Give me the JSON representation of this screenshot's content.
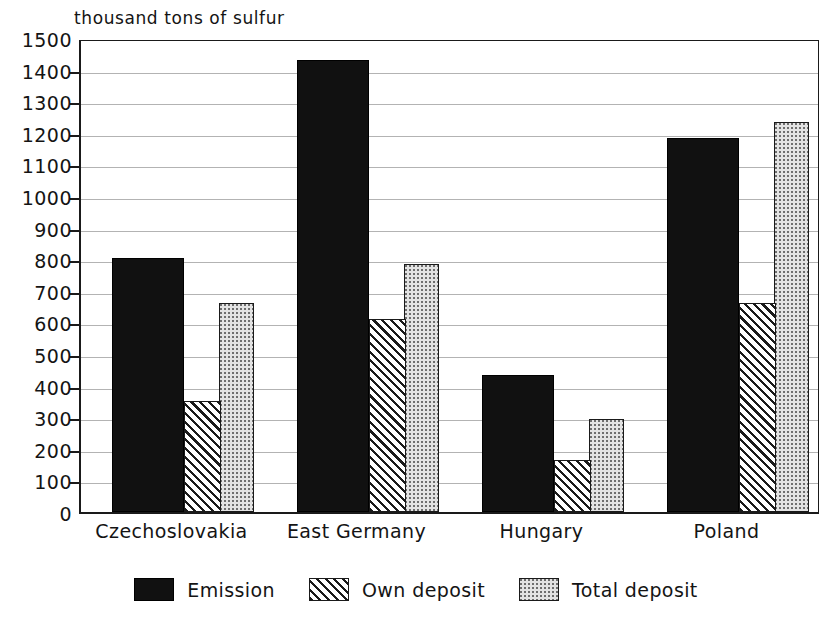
{
  "chart_data": {
    "type": "bar",
    "title": "thousand tons of sulfur",
    "xlabel": "",
    "ylabel": "thousand tons of sulfur",
    "ylim": [
      0,
      1500
    ],
    "ytick_step": 100,
    "yticks": [
      0,
      100,
      200,
      300,
      400,
      500,
      600,
      700,
      800,
      900,
      1000,
      1100,
      1200,
      1300,
      1400,
      1500
    ],
    "ytick_labels": [
      "0",
      "100",
      "200",
      "300",
      "400",
      "500",
      "600",
      "700",
      "800",
      "900",
      "1000",
      "1100",
      "1200",
      "1300",
      "1400",
      "1500"
    ],
    "grid": true,
    "grid_axis": "y",
    "legend_position": "bottom-center",
    "categories": [
      "Czechoslovakia",
      "East Germany",
      "Hungary",
      "Poland"
    ],
    "series": [
      {
        "name": "Emission",
        "values": [
          805,
          1430,
          435,
          1185
        ],
        "fill": "solid-black",
        "color": "#111111"
      },
      {
        "name": "Own deposit",
        "values": [
          350,
          610,
          165,
          660
        ],
        "fill": "diagonal-hatch",
        "color": "#1a1a1a"
      },
      {
        "name": "Total deposit",
        "values": [
          660,
          785,
          295,
          1235
        ],
        "fill": "stipple-dots",
        "color": "#e3e3e3"
      }
    ]
  },
  "legend": {
    "items": [
      {
        "label": "Emission",
        "swatch": "solid-black-swatch"
      },
      {
        "label": "Own deposit",
        "swatch": "diagonal-hatch-swatch"
      },
      {
        "label": "Total deposit",
        "swatch": "stipple-dots-swatch"
      }
    ]
  },
  "colors": {
    "axis": "#1a1a1a",
    "gridline": "#9a9a9a",
    "emission": "#111111",
    "own_deposit": "#1a1a1a",
    "total_deposit": "#e3e3e3",
    "background": "#ffffff"
  }
}
